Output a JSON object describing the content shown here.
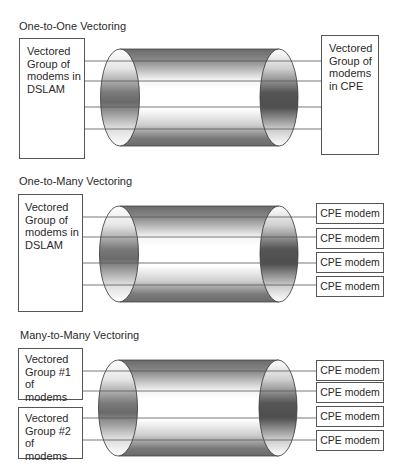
{
  "sections": [
    {
      "title": "One-to-One Vectoring",
      "left_boxes": [
        "Vectored\nGroup of\nmodems in\nDSLAM"
      ],
      "right_boxes": [
        "Vectored\nGroup of\nmodems\nin CPE"
      ]
    },
    {
      "title": "One-to-Many Vectoring",
      "left_boxes": [
        "Vectored\nGroup of\nmodems in\nDSLAM"
      ],
      "right_boxes": [
        "CPE modem",
        "CPE modem",
        "CPE modem",
        "CPE modem"
      ]
    },
    {
      "title": "Many-to-Many Vectoring",
      "left_boxes": [
        "Vectored\nGroup #1 of\nmodems",
        "Vectored\nGroup #2 of\nmodems"
      ],
      "right_boxes": [
        "CPE modem",
        "CPE modem",
        "CPE modem",
        "CPE modem"
      ]
    }
  ],
  "colors": {
    "line": "#555555",
    "cable_dark": "#6e6e6e",
    "cable_light": "#ffffff"
  }
}
